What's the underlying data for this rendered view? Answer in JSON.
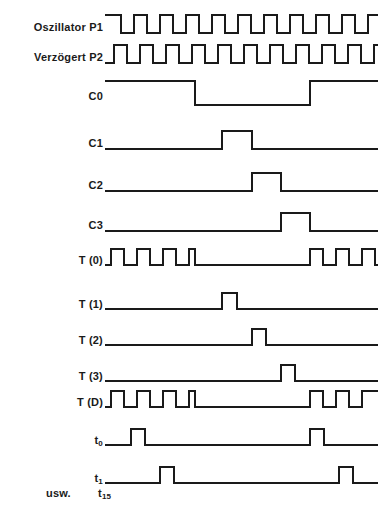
{
  "diagram": {
    "line_color": "#1a1a1a",
    "background_color": "#ffffff",
    "footer": {
      "usw_label": "usw.",
      "t15_label": "t",
      "t15_sub": "15"
    }
  },
  "chart_data": {
    "type": "line",
    "xlabel": "",
    "ylabel": "",
    "grid": false,
    "legend": "none",
    "x_range": [
      0,
      273
    ],
    "signal_high_value": 1,
    "signal_low_value": 0,
    "rows": [
      {
        "label": "Oszillator P1",
        "label_sub": "",
        "y": 14,
        "wave_height": 20,
        "starts_high": true,
        "description": "Rechtecksignal, beginnt High, 10 volle Perioden",
        "transitions": [
          0,
          16,
          29,
          42,
          55,
          68,
          81,
          94,
          107,
          120,
          133,
          146,
          159,
          172,
          185,
          198,
          211,
          224,
          237,
          250,
          263
        ]
      },
      {
        "label": "Verzögert P2",
        "label_sub": "",
        "y": 44,
        "wave_height": 20,
        "starts_high": false,
        "description": "Rechtecksignal, um eine halbe Periode verzoegert, beginnt Low",
        "transitions": [
          0,
          9,
          22,
          35,
          48,
          61,
          74,
          87,
          100,
          113,
          126,
          139,
          152,
          165,
          178,
          191,
          204,
          217,
          230,
          243,
          256,
          269
        ]
      },
      {
        "label": "C0",
        "label_sub": "",
        "y": 80,
        "wave_height": 26,
        "starts_high": true,
        "description": "Zaehlerbit 0, High bis x=90, dann Low bis x=205, dann High",
        "transitions": [
          0,
          90,
          205
        ]
      },
      {
        "label": "C1",
        "label_sub": "",
        "y": 130,
        "wave_height": 20,
        "starts_high": false,
        "description": "Einzelner breiter Impuls",
        "transitions": [
          0,
          117,
          147
        ]
      },
      {
        "label": "C2",
        "label_sub": "",
        "y": 172,
        "wave_height": 20,
        "starts_high": false,
        "description": "Einzelner breiter Impuls, spaeter",
        "transitions": [
          0,
          147,
          176
        ]
      },
      {
        "label": "C3",
        "label_sub": "",
        "y": 212,
        "wave_height": 20,
        "starts_high": false,
        "description": "Einzelner breiter Impuls, noch spaeter",
        "transitions": [
          0,
          176,
          205
        ]
      },
      {
        "label": "T (0)",
        "label_sub": "",
        "y": 248,
        "wave_height": 18,
        "starts_high": false,
        "description": "Impulszug: 4 Impulse am Anfang, Pause, 2 Impulse am Ende",
        "transitions": [
          0,
          6,
          19,
          32,
          45,
          58,
          71,
          84,
          90,
          205,
          218,
          231,
          244,
          257,
          270
        ]
      },
      {
        "label": "T (1)",
        "label_sub": "",
        "y": 292,
        "wave_height": 18,
        "starts_high": false,
        "description": "Schmaler Einzelimpuls",
        "transitions": [
          0,
          117,
          132
        ]
      },
      {
        "label": "T (2)",
        "label_sub": "",
        "y": 328,
        "wave_height": 18,
        "starts_high": false,
        "description": "Schmaler Einzelimpuls, spaeter",
        "transitions": [
          0,
          147,
          161
        ]
      },
      {
        "label": "T (3)",
        "label_sub": "",
        "y": 364,
        "wave_height": 18,
        "starts_high": false,
        "description": "Schmaler Einzelimpuls, noch spaeter",
        "transitions": [
          0,
          176,
          190
        ]
      },
      {
        "label": "T (D)",
        "label_sub": "",
        "y": 390,
        "wave_height": 18,
        "starts_high": false,
        "description": "Impulszug: 4 Impulse am Anfang, Pause, Impulse am Ende, endet High",
        "transitions": [
          0,
          6,
          19,
          32,
          45,
          58,
          71,
          84,
          90,
          205,
          218,
          231,
          244,
          257
        ]
      },
      {
        "label": "t",
        "label_sub": "0",
        "y": 428,
        "wave_height": 18,
        "starts_high": false,
        "description": "Schmaler Impuls bei x=26 und bei x=205",
        "transitions": [
          0,
          26,
          40,
          205,
          219
        ]
      },
      {
        "label": "t",
        "label_sub": "1",
        "y": 466,
        "wave_height": 18,
        "starts_high": false,
        "description": "Schmaler Impuls bei x=55 und bei x=234",
        "transitions": [
          0,
          55,
          69,
          234,
          248
        ]
      }
    ]
  }
}
